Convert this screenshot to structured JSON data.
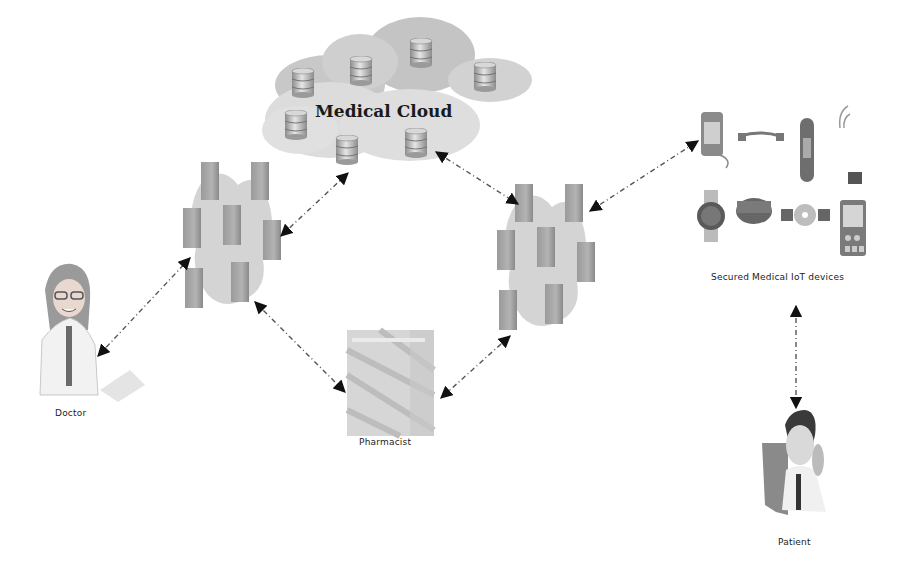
{
  "diagram": {
    "title": "Medical Cloud",
    "nodes": [
      {
        "id": "cloud",
        "label": "Medical Cloud",
        "icon": "cloud-database-icon"
      },
      {
        "id": "server_left",
        "label": "",
        "icon": "server-cluster-icon"
      },
      {
        "id": "server_right",
        "label": "",
        "icon": "server-cluster-icon"
      },
      {
        "id": "doctor",
        "label": "Doctor",
        "icon": "doctor-icon"
      },
      {
        "id": "pharmacist",
        "label": "Pharmacist",
        "icon": "pharmacy-icon"
      },
      {
        "id": "iot",
        "label": "Secured  Medical IoT devices",
        "icon": "iot-devices-icon"
      },
      {
        "id": "patient",
        "label": "Patient",
        "icon": "patient-icon"
      }
    ],
    "edges": [
      {
        "from": "doctor",
        "to": "server_left",
        "style": "dashed",
        "bidirectional": true
      },
      {
        "from": "server_left",
        "to": "cloud",
        "style": "dashed",
        "bidirectional": true
      },
      {
        "from": "cloud",
        "to": "server_right",
        "style": "dashed",
        "bidirectional": true
      },
      {
        "from": "server_right",
        "to": "iot",
        "style": "dashed",
        "bidirectional": true
      },
      {
        "from": "server_left",
        "to": "pharmacist",
        "style": "dashed",
        "bidirectional": true
      },
      {
        "from": "server_right",
        "to": "pharmacist",
        "style": "dashed",
        "bidirectional": true
      },
      {
        "from": "iot",
        "to": "patient",
        "style": "dashed",
        "bidirectional": true
      }
    ]
  },
  "labels": {
    "cloud": "Medical Cloud",
    "doctor": "Doctor",
    "pharmacist": "Pharmacist",
    "iot": "Secured  Medical IoT devices",
    "patient": "Patient"
  }
}
